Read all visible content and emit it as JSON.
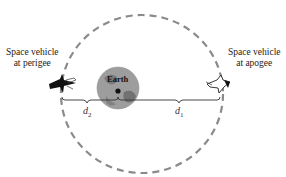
{
  "diagram": {
    "type": "elliptical-orbit",
    "labels": {
      "perigee_line1": "Space vehicle",
      "perigee_line2": "at perigee",
      "apogee_line1": "Space vehicle",
      "apogee_line2": "at apogee",
      "earth": "Earth",
      "d1_base": "d",
      "d1_sub": "1",
      "d2_base": "d",
      "d2_sub": "2"
    },
    "colors": {
      "orbit": "#8a8a8a",
      "earth_fill": "#9a9a9a",
      "earth_dark": "#6e6e6e",
      "line": "#333333",
      "vehicle": "#111111"
    }
  }
}
